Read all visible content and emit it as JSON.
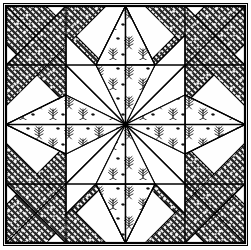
{
  "figure": {
    "kind": "quilt-block-diagram",
    "width": 251,
    "height": 250,
    "background_color": "#fefefe"
  },
  "colors": {
    "ink": "#1a1a1a",
    "line": "#000000",
    "background": "#ffffff",
    "hatch_base": "#ffffff",
    "hatch_ink": "#2b2b2b",
    "hatch_mid": "#8a8a8a",
    "floral_ink": "#111111",
    "border": "#000000"
  },
  "frame": {
    "outer": {
      "x": 3,
      "y": 3,
      "width": 245,
      "height": 243,
      "stroke_width": 1
    },
    "inner": {
      "x": 6,
      "y": 6,
      "width": 239,
      "height": 237,
      "stroke_width": 2.2
    }
  },
  "grid": {
    "label": "four-by-four patch grid",
    "columns": 4,
    "rows": 4,
    "x_lines": [
      6,
      66,
      125,
      185,
      245
    ],
    "y_lines": [
      6,
      65,
      124,
      184,
      243
    ],
    "stroke_width": 1.3
  },
  "patterns": {
    "hatch": {
      "name": "stippled-diagonal-fill",
      "description": "dark stipple with scattered white dots",
      "tile": 6,
      "dot_radius": 0.85,
      "dot_color": "#ffffff"
    },
    "floral": {
      "name": "leafy-sprig-fill",
      "description": "hand drawn leaf sprigs on white",
      "tile": 26
    }
  },
  "star": {
    "name": "eight-pointed-star",
    "center": {
      "x": 125.5,
      "y": 124.5
    },
    "point_outer_radius": 118,
    "point_inner_radius": 60,
    "point_count": 8,
    "fill_pattern": "floral"
  },
  "bands": {
    "name": "diagonal-sashing-bands",
    "count": 8,
    "fill_pattern": "hatch",
    "half_width": 19
  },
  "regions": [
    {
      "name": "corner-top-left",
      "fill": "background"
    },
    {
      "name": "corner-top-right",
      "fill": "background"
    },
    {
      "name": "corner-bottom-left",
      "fill": "background"
    },
    {
      "name": "corner-bottom-right",
      "fill": "background"
    },
    {
      "name": "star-point-north",
      "fill": "floral"
    },
    {
      "name": "star-point-east",
      "fill": "floral"
    },
    {
      "name": "star-point-south",
      "fill": "floral"
    },
    {
      "name": "star-point-west",
      "fill": "floral"
    },
    {
      "name": "star-point-northeast",
      "fill": "background"
    },
    {
      "name": "star-point-northwest",
      "fill": "background"
    },
    {
      "name": "star-point-southeast",
      "fill": "background"
    },
    {
      "name": "star-point-southwest",
      "fill": "background"
    }
  ]
}
